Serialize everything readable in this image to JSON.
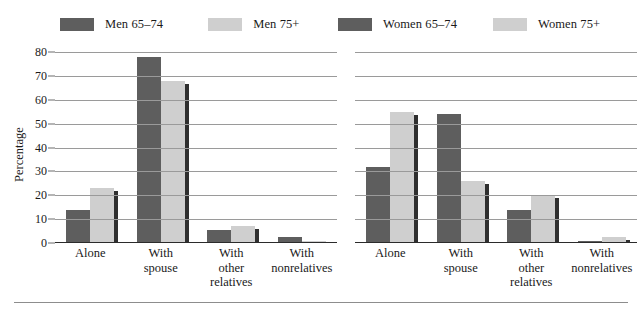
{
  "figure": {
    "y_axis_title": "Percentage",
    "y_ticks": [
      "80",
      "70",
      "60",
      "50",
      "40",
      "30",
      "20",
      "10",
      "0"
    ],
    "colors": {
      "series_dark": "#5e5e5e",
      "series_light": "#cfcfcf",
      "shadow": "#2f2f2f",
      "gridline": "#9a9a9a",
      "axis": "#2b2b2b"
    }
  },
  "chart_data": [
    {
      "type": "bar",
      "title": "",
      "panel": "men",
      "categories": [
        "Alone",
        "With spouse",
        "With other relatives",
        "With nonrelatives"
      ],
      "category_lines": [
        [
          "Alone"
        ],
        [
          "With",
          "spouse"
        ],
        [
          "With",
          "other",
          "relatives"
        ],
        [
          "With",
          "nonrelatives"
        ]
      ],
      "series": [
        {
          "name": "Men 65–74",
          "color": "#5e5e5e",
          "values": [
            14,
            78,
            5.3,
            2.5
          ]
        },
        {
          "name": "Men 75+",
          "color": "#cfcfcf",
          "values": [
            23,
            68,
            7.3,
            1
          ]
        }
      ],
      "xlabel": "",
      "ylabel": "Percentage",
      "ylim": [
        0,
        80
      ],
      "yticks": [
        0,
        10,
        20,
        30,
        40,
        50,
        60,
        70,
        80
      ],
      "grid": true,
      "legend_position": "top"
    },
    {
      "type": "bar",
      "title": "",
      "panel": "women",
      "categories": [
        "Alone",
        "With spouse",
        "With other relatives",
        "With nonrelatives"
      ],
      "category_lines": [
        [
          "Alone"
        ],
        [
          "With",
          "spouse"
        ],
        [
          "With",
          "other",
          "relatives"
        ],
        [
          "With",
          "nonrelatives"
        ]
      ],
      "series": [
        {
          "name": "Women 65–74",
          "color": "#5e5e5e",
          "values": [
            32,
            54,
            14,
            1
          ]
        },
        {
          "name": "Women 75+",
          "color": "#cfcfcf",
          "values": [
            55,
            26,
            20,
            2.5
          ]
        }
      ],
      "xlabel": "",
      "ylabel": "Percentage",
      "ylim": [
        0,
        80
      ],
      "yticks": [
        0,
        10,
        20,
        30,
        40,
        50,
        60,
        70,
        80
      ],
      "grid": true,
      "legend_position": "top"
    }
  ]
}
